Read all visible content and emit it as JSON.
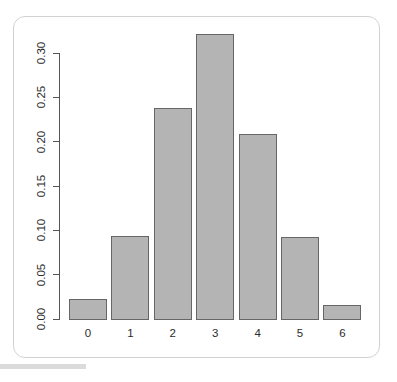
{
  "figure": {
    "background_color": "#ffffff",
    "card_border_color": "#d2d2d2",
    "axis_color": "#555555"
  },
  "chart_data": {
    "type": "bar",
    "title": "",
    "subtitle": "",
    "xlabel": "",
    "ylabel": "",
    "categories": [
      "0",
      "1",
      "2",
      "3",
      "4",
      "5",
      "6"
    ],
    "values": [
      0.023,
      0.094,
      0.238,
      0.321,
      0.209,
      0.092,
      0.016
    ],
    "ylim": [
      0.0,
      0.325
    ],
    "xlim": [
      0,
      7
    ],
    "y_ticks": [
      0.0,
      0.05,
      0.1,
      0.15,
      0.2,
      0.25,
      0.3
    ],
    "y_tick_labels": [
      "0.00",
      "0.05",
      "0.10",
      "0.15",
      "0.20",
      "0.25",
      "0.30"
    ],
    "x_tick_labels": [
      "0",
      "1",
      "2",
      "3",
      "4",
      "5",
      "6"
    ],
    "grid": false,
    "legend": null,
    "legend_position": "none",
    "bar_fill_color": "#b4b4b4",
    "bar_border_color": "#666666",
    "y_tick_label_rotation": 90,
    "annotations": []
  }
}
